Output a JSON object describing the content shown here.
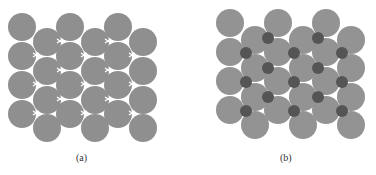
{
  "figure": {
    "panels": [
      {
        "label": "(a)",
        "description": "Close-packed layer of large spheres with tetrahedral/octahedral voids",
        "sphere_color": "#8f8f8f",
        "radius": 14,
        "spheres": [
          [
            22,
            27
          ],
          [
            22,
            56
          ],
          [
            22,
            85
          ],
          [
            22,
            114
          ],
          [
            47,
            42
          ],
          [
            47,
            71
          ],
          [
            47,
            100
          ],
          [
            47,
            128
          ],
          [
            70,
            27
          ],
          [
            70,
            56
          ],
          [
            70,
            85
          ],
          [
            70,
            114
          ],
          [
            95,
            42
          ],
          [
            95,
            71
          ],
          [
            95,
            100
          ],
          [
            95,
            128
          ],
          [
            118,
            27
          ],
          [
            118,
            56
          ],
          [
            118,
            85
          ],
          [
            118,
            114
          ],
          [
            143,
            42
          ],
          [
            143,
            71
          ],
          [
            143,
            100
          ],
          [
            143,
            128
          ]
        ],
        "voids": [
          [
            60,
            41
          ],
          [
            108,
            41
          ],
          [
            36,
            55
          ],
          [
            84,
            55
          ],
          [
            132,
            55
          ],
          [
            60,
            70
          ],
          [
            108,
            70
          ],
          [
            36,
            84
          ],
          [
            84,
            84
          ],
          [
            132,
            84
          ],
          [
            60,
            99
          ],
          [
            108,
            99
          ],
          [
            36,
            113
          ],
          [
            84,
            113
          ],
          [
            132,
            113
          ]
        ]
      },
      {
        "label": "(b)",
        "description": "Same layer with small dark spheres occupying the voids",
        "sphere_color": "#939393",
        "small_color": "#555555",
        "radius": 14,
        "small_radius": 6,
        "spheres": [
          [
            230,
            23
          ],
          [
            230,
            52
          ],
          [
            230,
            81
          ],
          [
            230,
            110
          ],
          [
            255,
            40
          ],
          [
            255,
            68
          ],
          [
            255,
            97
          ],
          [
            255,
            125
          ],
          [
            278,
            23
          ],
          [
            278,
            52
          ],
          [
            278,
            81
          ],
          [
            278,
            110
          ],
          [
            303,
            40
          ],
          [
            303,
            68
          ],
          [
            303,
            97
          ],
          [
            303,
            125
          ],
          [
            326,
            23
          ],
          [
            326,
            52
          ],
          [
            326,
            81
          ],
          [
            326,
            110
          ],
          [
            351,
            40
          ],
          [
            351,
            68
          ],
          [
            351,
            97
          ],
          [
            351,
            125
          ]
        ],
        "small_spheres": [
          [
            268,
            38
          ],
          [
            318,
            38
          ],
          [
            246,
            53
          ],
          [
            294,
            53
          ],
          [
            342,
            53
          ],
          [
            268,
            68
          ],
          [
            318,
            68
          ],
          [
            246,
            82
          ],
          [
            294,
            82
          ],
          [
            342,
            82
          ],
          [
            268,
            97
          ],
          [
            318,
            97
          ],
          [
            246,
            111
          ],
          [
            294,
            111
          ],
          [
            342,
            111
          ]
        ]
      }
    ]
  }
}
